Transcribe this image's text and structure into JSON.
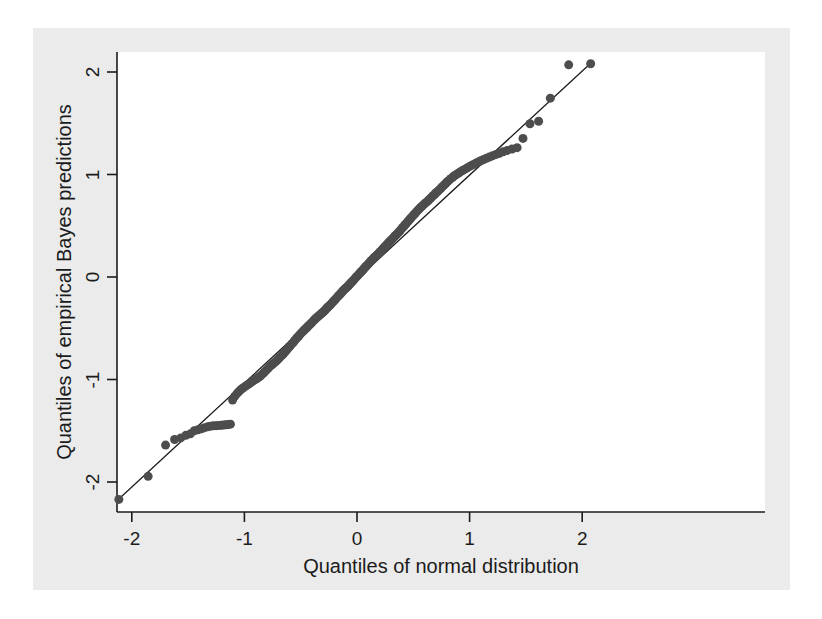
{
  "figure": {
    "background_color": "#ebebeb",
    "plot_background_color": "#ffffff",
    "canvas_color": "#ffffff"
  },
  "chart_data": {
    "type": "scatter",
    "title": "",
    "subtitle": "",
    "xlabel": "Quantiles of normal distribution",
    "ylabel": "Quantiles of empirical Bayes predictions",
    "xlim": [
      -2.3,
      2.25
    ],
    "ylim": [
      -2.35,
      2.3
    ],
    "xticks": [
      -2,
      -1,
      0,
      1,
      2
    ],
    "xticklabels": [
      "-2",
      "-1",
      "0",
      "1",
      "2"
    ],
    "yticks": [
      -2,
      -1,
      0,
      1,
      2
    ],
    "yticklabels": [
      "-2",
      "-1",
      "0",
      "1",
      "2"
    ],
    "grid": false,
    "legend": null,
    "marker_color": "#4d4d4d",
    "marker_size": 9,
    "reference_line": {
      "label": "45-degree reference line",
      "color": "#1b1b1b",
      "width": 1.3,
      "x": [
        -2.12,
        2.08
      ],
      "y": [
        -2.17,
        2.09
      ]
    },
    "series": [
      {
        "name": "Empirical Bayes predictions vs normal quantiles",
        "x": [
          -2.115,
          -1.855,
          -1.7,
          -1.62,
          -1.565,
          -1.52,
          -1.48,
          -1.445,
          -1.412,
          -1.382,
          -1.353,
          -1.326,
          -1.3,
          -1.275,
          -1.251,
          -1.228,
          -1.206,
          -1.185,
          -1.164,
          -1.144,
          -1.124,
          -1.105,
          -1.086,
          -1.068,
          -1.05,
          -1.033,
          -1.016,
          -0.999,
          -0.982,
          -0.966,
          -0.95,
          -0.934,
          -0.919,
          -0.904,
          -0.889,
          -0.874,
          -0.859,
          -0.845,
          -0.831,
          -0.817,
          -0.803,
          -0.789,
          -0.776,
          -0.762,
          -0.749,
          -0.736,
          -0.723,
          -0.71,
          -0.697,
          -0.685,
          -0.672,
          -0.66,
          -0.648,
          -0.635,
          -0.623,
          -0.611,
          -0.599,
          -0.588,
          -0.576,
          -0.564,
          -0.553,
          -0.541,
          -0.53,
          -0.518,
          -0.507,
          -0.496,
          -0.485,
          -0.474,
          -0.463,
          -0.452,
          -0.441,
          -0.43,
          -0.419,
          -0.408,
          -0.398,
          -0.387,
          -0.376,
          -0.366,
          -0.355,
          -0.345,
          -0.334,
          -0.324,
          -0.313,
          -0.303,
          -0.293,
          -0.282,
          -0.272,
          -0.262,
          -0.252,
          -0.241,
          -0.231,
          -0.221,
          -0.211,
          -0.201,
          -0.191,
          -0.181,
          -0.171,
          -0.161,
          -0.151,
          -0.141,
          -0.131,
          -0.121,
          -0.111,
          -0.101,
          -0.091,
          -0.081,
          -0.071,
          -0.061,
          -0.051,
          -0.041,
          -0.031,
          -0.021,
          -0.011,
          -0.001,
          0.009,
          0.019,
          0.029,
          0.039,
          0.049,
          0.059,
          0.069,
          0.079,
          0.089,
          0.099,
          0.109,
          0.119,
          0.129,
          0.139,
          0.149,
          0.159,
          0.169,
          0.179,
          0.189,
          0.199,
          0.209,
          0.219,
          0.229,
          0.239,
          0.25,
          0.26,
          0.27,
          0.281,
          0.291,
          0.301,
          0.312,
          0.322,
          0.332,
          0.343,
          0.353,
          0.364,
          0.375,
          0.385,
          0.396,
          0.407,
          0.418,
          0.429,
          0.44,
          0.451,
          0.462,
          0.473,
          0.484,
          0.496,
          0.507,
          0.519,
          0.53,
          0.542,
          0.554,
          0.566,
          0.578,
          0.59,
          0.602,
          0.615,
          0.627,
          0.64,
          0.653,
          0.666,
          0.679,
          0.692,
          0.705,
          0.719,
          0.733,
          0.747,
          0.761,
          0.776,
          0.79,
          0.805,
          0.821,
          0.836,
          0.852,
          0.868,
          0.885,
          0.902,
          0.919,
          0.937,
          0.955,
          0.974,
          0.993,
          1.013,
          1.034,
          1.055,
          1.077,
          1.1,
          1.124,
          1.149,
          1.175,
          1.203,
          1.232,
          1.264,
          1.298,
          1.335,
          1.376,
          1.422,
          1.474,
          1.536,
          1.613,
          1.717,
          1.88,
          2.075
        ],
        "y": [
          -2.17,
          -1.945,
          -1.64,
          -1.585,
          -1.57,
          -1.545,
          -1.53,
          -1.5,
          -1.49,
          -1.48,
          -1.47,
          -1.462,
          -1.455,
          -1.452,
          -1.45,
          -1.448,
          -1.446,
          -1.444,
          -1.442,
          -1.44,
          -1.436,
          -1.2,
          -1.165,
          -1.14,
          -1.12,
          -1.1,
          -1.085,
          -1.072,
          -1.06,
          -1.048,
          -1.035,
          -1.022,
          -1.01,
          -1.0,
          -0.99,
          -0.978,
          -0.966,
          -0.952,
          -0.938,
          -0.922,
          -0.906,
          -0.89,
          -0.875,
          -0.862,
          -0.85,
          -0.838,
          -0.826,
          -0.812,
          -0.798,
          -0.784,
          -0.77,
          -0.756,
          -0.742,
          -0.726,
          -0.71,
          -0.694,
          -0.678,
          -0.664,
          -0.65,
          -0.636,
          -0.62,
          -0.604,
          -0.59,
          -0.576,
          -0.562,
          -0.548,
          -0.536,
          -0.524,
          -0.512,
          -0.5,
          -0.488,
          -0.476,
          -0.464,
          -0.452,
          -0.44,
          -0.428,
          -0.416,
          -0.405,
          -0.394,
          -0.384,
          -0.374,
          -0.364,
          -0.354,
          -0.344,
          -0.334,
          -0.322,
          -0.31,
          -0.298,
          -0.288,
          -0.276,
          -0.264,
          -0.252,
          -0.24,
          -0.228,
          -0.216,
          -0.204,
          -0.192,
          -0.18,
          -0.168,
          -0.156,
          -0.144,
          -0.132,
          -0.12,
          -0.11,
          -0.1,
          -0.09,
          -0.078,
          -0.066,
          -0.054,
          -0.042,
          -0.03,
          -0.018,
          -0.006,
          0.006,
          0.018,
          0.03,
          0.042,
          0.054,
          0.066,
          0.078,
          0.09,
          0.102,
          0.114,
          0.126,
          0.138,
          0.15,
          0.162,
          0.174,
          0.186,
          0.196,
          0.206,
          0.216,
          0.226,
          0.238,
          0.25,
          0.262,
          0.274,
          0.286,
          0.298,
          0.31,
          0.322,
          0.334,
          0.346,
          0.358,
          0.37,
          0.382,
          0.394,
          0.406,
          0.418,
          0.43,
          0.442,
          0.456,
          0.47,
          0.484,
          0.498,
          0.512,
          0.526,
          0.54,
          0.554,
          0.568,
          0.582,
          0.596,
          0.61,
          0.624,
          0.638,
          0.652,
          0.666,
          0.68,
          0.692,
          0.704,
          0.716,
          0.728,
          0.74,
          0.754,
          0.768,
          0.782,
          0.796,
          0.81,
          0.824,
          0.838,
          0.852,
          0.868,
          0.884,
          0.9,
          0.916,
          0.932,
          0.948,
          0.962,
          0.976,
          0.99,
          1.002,
          1.014,
          1.026,
          1.038,
          1.05,
          1.062,
          1.074,
          1.086,
          1.098,
          1.11,
          1.122,
          1.134,
          1.146,
          1.158,
          1.17,
          1.182,
          1.194,
          1.206,
          1.222,
          1.235,
          1.248,
          1.262,
          1.352,
          1.495,
          1.52,
          1.745,
          2.07,
          2.08
        ]
      }
    ]
  }
}
